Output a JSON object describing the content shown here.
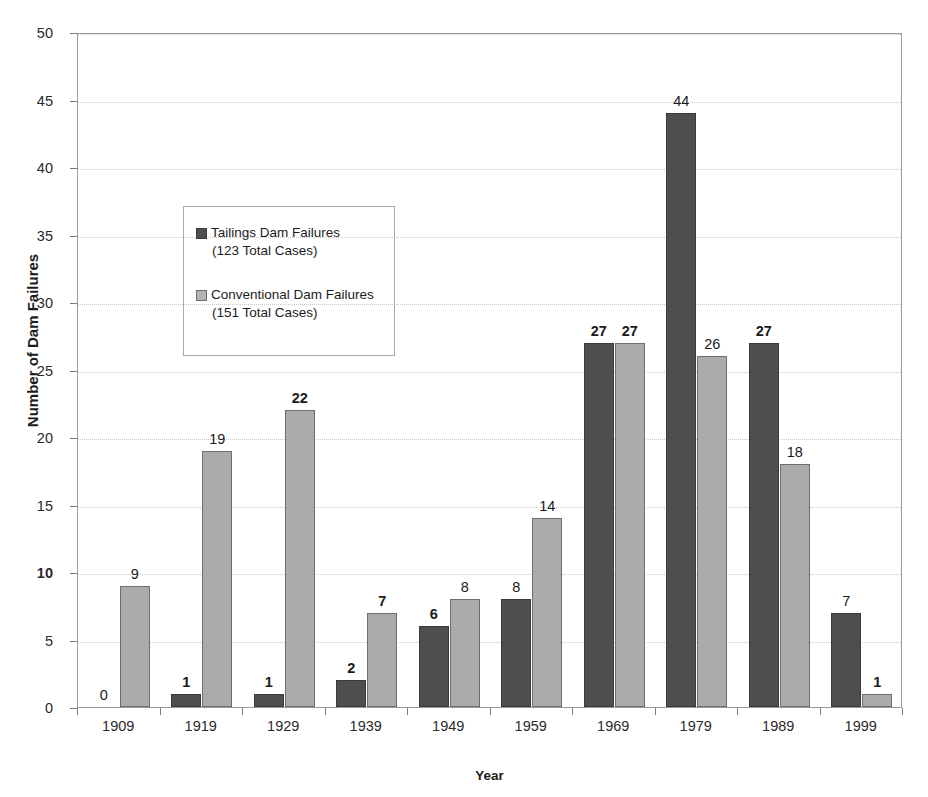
{
  "chart_data": {
    "type": "bar",
    "title": "",
    "xlabel": "Year",
    "ylabel": "Number of Dam Failures",
    "categories": [
      "1909",
      "1919",
      "1929",
      "1939",
      "1949",
      "1959",
      "1969",
      "1979",
      "1989",
      "1999"
    ],
    "series": [
      {
        "name": "Tailings Dam Failures",
        "legend_sub": "(123 Total Cases)",
        "total": 123,
        "color": "#4e4e4e",
        "values": [
          0,
          1,
          1,
          2,
          6,
          8,
          27,
          44,
          27,
          7
        ],
        "labels": [
          "0",
          "1",
          "1",
          "2",
          "6",
          "8",
          "27",
          "44",
          "27",
          "7"
        ],
        "label_bold": [
          false,
          true,
          true,
          true,
          true,
          false,
          true,
          false,
          true,
          false
        ]
      },
      {
        "name": "Conventional Dam Failures",
        "legend_sub": "(151 Total Cases)",
        "total": 151,
        "color": "#ababab",
        "values": [
          9,
          19,
          22,
          7,
          8,
          14,
          27,
          26,
          18,
          1
        ],
        "labels": [
          "9",
          "19",
          "22",
          "7",
          "8",
          "14",
          "27",
          "26",
          "18",
          "1"
        ],
        "label_bold": [
          false,
          false,
          true,
          true,
          false,
          false,
          true,
          false,
          false,
          true
        ]
      }
    ],
    "ylim": [
      0,
      50
    ],
    "yticks": [
      0,
      5,
      10,
      15,
      20,
      25,
      30,
      35,
      40,
      45,
      50
    ],
    "ytick_labels": [
      "0",
      "5",
      "10",
      "15",
      "20",
      "25",
      "30",
      "35",
      "40",
      "45",
      "50"
    ],
    "ytick_bold": [
      false,
      false,
      true,
      false,
      false,
      false,
      false,
      false,
      false,
      false,
      false
    ],
    "grid": true,
    "grid_axis": "y",
    "legend_position": "upper-left-inside"
  },
  "legend": {
    "entries": [
      {
        "label": "Tailings Dam Failures",
        "sub": "(123 Total Cases)",
        "swatch": "dark-square-icon"
      },
      {
        "label": "Conventional Dam Failures",
        "sub": "(151 Total Cases)",
        "swatch": "light-square-icon"
      }
    ]
  },
  "axes": {
    "y_title": "Number of Dam Failures",
    "x_title": "Year"
  }
}
